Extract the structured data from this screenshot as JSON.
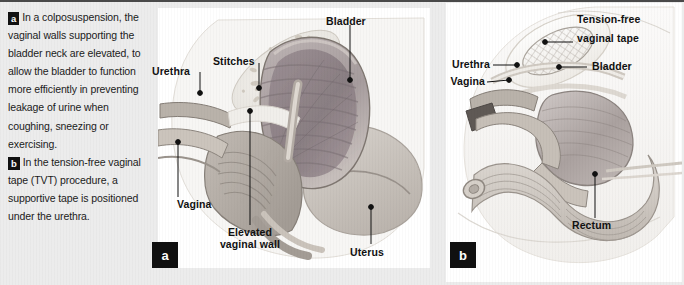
{
  "figure": {
    "background_color": "#ececec",
    "panel_background": "#ffffff",
    "label_color": "#111111",
    "badge_color": "#101010"
  },
  "caption": {
    "badge_a": "a",
    "text_a": "In a colposuspension, the vaginal walls supporting the bladder neck are elevated, to allow the bladder to function more efficiently in preventing leakage of urine when coughing, sneezing or exercising.",
    "badge_b": "b",
    "text_b": "In the tension-free vaginal tape (TVT) procedure, a supportive tape is positioned under the urethra."
  },
  "panel_a": {
    "badge": "a",
    "labels": {
      "urethra": "Urethra",
      "stitches": "Stitches",
      "bladder": "Bladder",
      "vagina": "Vagina",
      "elevated_vaginal_wall_line1": "Elevated",
      "elevated_vaginal_wall_line2": "vaginal wall",
      "uterus": "Uterus"
    }
  },
  "panel_b": {
    "badge": "b",
    "labels": {
      "tension_free_line1": "Tension-free",
      "tension_free_line2": "vaginal tape",
      "urethra": "Urethra",
      "vagina": "Vagina",
      "bladder": "Bladder",
      "rectum": "Rectum"
    }
  },
  "colors": {
    "tissue_light": "#d8d3cd",
    "tissue_mid": "#b5aea8",
    "tissue_dark": "#8f8983",
    "organ_mauve": "#9b8f92",
    "organ_mauve_dark": "#7e7276",
    "outline": "#6f6a66"
  }
}
